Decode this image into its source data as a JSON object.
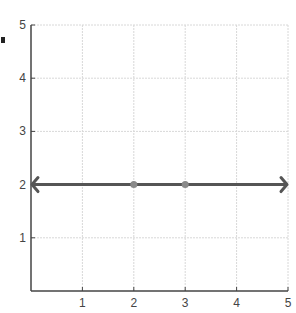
{
  "chart_data": {
    "type": "line",
    "title": "",
    "xlabel": "",
    "ylabel": "",
    "xlim": [
      0,
      5
    ],
    "ylim": [
      0,
      5
    ],
    "x_ticks": [
      1,
      2,
      3,
      4,
      5
    ],
    "y_ticks": [
      1,
      2,
      3,
      4,
      5
    ],
    "grid": true,
    "series": [
      {
        "name": "y = 2",
        "kind": "line with arrows at both ends",
        "x": [
          0,
          5
        ],
        "y": [
          2,
          2
        ],
        "color": "#555555"
      },
      {
        "name": "points",
        "kind": "scatter",
        "x": [
          2,
          3
        ],
        "y": [
          2,
          2
        ],
        "color": "#888888"
      }
    ]
  },
  "colors": {
    "axis": "#444444",
    "grid": "#d8d8d8",
    "line": "#555555",
    "point": "#8a8a8a"
  }
}
